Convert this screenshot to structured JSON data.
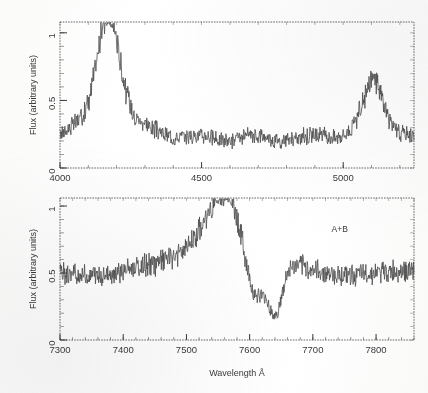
{
  "figure": {
    "background_color": "#ffffff",
    "ink_color": "#3a3a3a",
    "trace_color": "#4a4a4a",
    "panels": [
      {
        "id": "top-panel",
        "annotation": "",
        "frame": {
          "x": 60,
          "y": 22,
          "width": 354,
          "height": 146
        }
      },
      {
        "id": "bottom-panel",
        "annotation": "A+B",
        "frame": {
          "x": 60,
          "y": 198,
          "width": 354,
          "height": 142
        }
      }
    ],
    "xlabel": "Wavelength Å"
  },
  "chart_data": [
    {
      "type": "line",
      "id": "top-panel",
      "title": "",
      "xlabel": "",
      "ylabel": "Flux (arbitrary units)",
      "xlim": [
        4000,
        5250
      ],
      "ylim": [
        0,
        1.08
      ],
      "xticks": [
        4000,
        4500,
        5000
      ],
      "xtick_labels": [
        "4000",
        "4500",
        "5000"
      ],
      "xminor_step": 100,
      "yticks": [
        0,
        0.5,
        1
      ],
      "ytick_labels": [
        "0",
        "0.5",
        "1"
      ],
      "yminor_step": 0.1,
      "grid": false,
      "legend": "none",
      "continuum_level": 0.22,
      "noise_amplitude": 0.055,
      "noise_seed": 17,
      "emission_lines": [
        {
          "center": 4172,
          "peak": 0.78,
          "width": 38,
          "label": ""
        },
        {
          "center": 5107,
          "peak": 0.34,
          "width": 34,
          "label": ""
        }
      ],
      "broad_components": [
        {
          "center": 4172,
          "peak": 0.16,
          "width": 120
        },
        {
          "center": 5107,
          "peak": 0.08,
          "width": 95
        }
      ],
      "x": [
        4000,
        4050,
        4100,
        4150,
        4172,
        4200,
        4250,
        4300,
        4400,
        4500,
        4600,
        4700,
        4800,
        4900,
        5000,
        5050,
        5107,
        5150,
        5200,
        5250
      ],
      "y": [
        0.21,
        0.26,
        0.33,
        0.72,
        1.0,
        0.58,
        0.27,
        0.21,
        0.22,
        0.22,
        0.23,
        0.22,
        0.22,
        0.23,
        0.26,
        0.33,
        0.56,
        0.33,
        0.24,
        0.21
      ]
    },
    {
      "type": "line",
      "id": "bottom-panel",
      "title": "",
      "xlabel": "Wavelength Å",
      "ylabel": "Flux (arbitrary units)",
      "xlim": [
        7300,
        7860
      ],
      "ylim": [
        0,
        1.06
      ],
      "xticks": [
        7300,
        7400,
        7500,
        7600,
        7700,
        7800
      ],
      "xtick_labels": [
        "7300",
        "7400",
        "7500",
        "7600",
        "7700",
        "7800"
      ],
      "xminor_step": 20,
      "yticks": [
        0,
        0.5,
        1
      ],
      "ytick_labels": [
        "0",
        "0.5",
        "1"
      ],
      "yminor_step": 0.1,
      "grid": false,
      "legend": "none",
      "annotation": "A+B",
      "continuum_level": 0.5,
      "noise_amplitude": 0.05,
      "noise_seed": 43,
      "emission_lines": [
        {
          "center": 7563,
          "peak": 0.42,
          "width": 32,
          "label": ""
        }
      ],
      "broad_components": [
        {
          "center": 7558,
          "peak": 0.18,
          "width": 70
        }
      ],
      "absorption_troughs": [
        {
          "center": 7607,
          "depth": 0.45,
          "width": 16
        },
        {
          "center": 7641,
          "depth": 0.4,
          "width": 11
        }
      ],
      "x": [
        7300,
        7350,
        7400,
        7450,
        7500,
        7530,
        7555,
        7570,
        7585,
        7600,
        7608,
        7620,
        7630,
        7641,
        7652,
        7665,
        7680,
        7700,
        7750,
        7800,
        7860
      ],
      "y": [
        0.5,
        0.49,
        0.5,
        0.5,
        0.55,
        0.7,
        0.92,
        0.88,
        0.72,
        0.4,
        0.05,
        0.08,
        0.3,
        0.04,
        0.22,
        0.3,
        0.36,
        0.4,
        0.42,
        0.4,
        0.39
      ]
    }
  ]
}
